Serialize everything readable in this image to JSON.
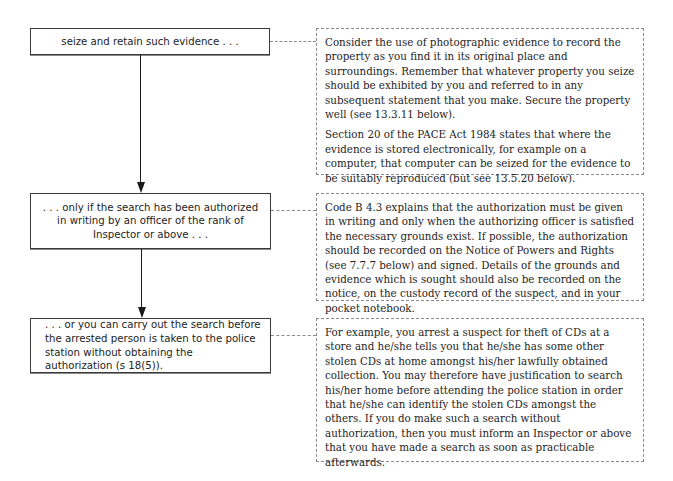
{
  "flowchart": {
    "steps": [
      {
        "text": "seize and retain such evidence . . ."
      },
      {
        "text": ". . . only if the search has been authorized in writing by an officer of the rank of Inspector or above . . ."
      },
      {
        "text": ". . . or you can carry out the search before the arrested person is taken to the police station without obtaining the authorization (s 18(5))."
      }
    ],
    "notes": [
      {
        "paragraphs": [
          "Consider the use of photographic evidence to record the property as you find it in its original place and surroundings. Remember that whatever property you seize should be exhibited by you and referred to in any subsequent statement that you make. Secure the property well (see 13.3.11 below).",
          "Section 20 of the PACE Act 1984 states that where the evidence is stored electronically, for example on a computer, that computer can be seized for the evidence to be suitably reproduced (but see 13.5.20 below)."
        ]
      },
      {
        "paragraphs": [
          "Code B 4.3 explains that the authorization must be given in writing and only when the authorizing officer is satisfied the necessary grounds exist. If possible, the authorization should be recorded on the Notice of Powers and Rights (see 7.7.7 below) and signed. Details of the grounds and evidence which is sought should also be recorded on the notice, on the custody record of the suspect, and in your pocket notebook."
        ]
      },
      {
        "paragraphs": [
          "For example, you arrest a suspect for theft of CDs at a store and he/she tells you that he/she has some other stolen CDs at home amongst his/her lawfully obtained collection. You may therefore have justification to search his/her home before attending the police station in order that he/she can identify the stolen CDs amongst the others. If you do make such a search without authorization, then you must inform an Inspector or above that you have made a search as soon as practicable afterwards."
        ]
      }
    ]
  }
}
